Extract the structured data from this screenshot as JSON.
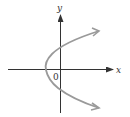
{
  "diagram": {
    "type": "parabola-graph",
    "axes": {
      "x_label": "x",
      "y_label": "y",
      "origin_label": "0"
    },
    "colors": {
      "axis": "#333333",
      "curve": "#9a9a9a",
      "background": "#ffffff"
    },
    "curve": {
      "orientation": "opens-right",
      "vertex_position": "left of origin on x-axis",
      "crosses_y_axis": "above and below origin"
    }
  }
}
